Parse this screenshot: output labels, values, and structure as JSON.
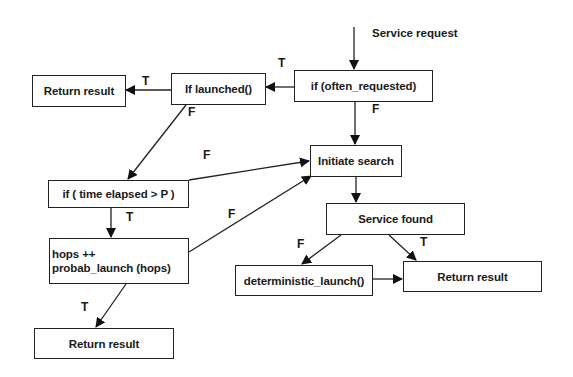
{
  "diagram": {
    "entry_label": "Service request",
    "nodes": {
      "often_requested": "if (often_requested)",
      "launched": "If launched()",
      "return_top": "Return result",
      "initiate_search": "Initiate search",
      "time_elapsed": "if ( time elapsed > P )",
      "hops_line1": "hops ++",
      "hops_line2": "probab_launch (hops)",
      "return_bottom": "Return result",
      "service_found": "Service found",
      "deterministic_launch": "deterministic_launch()",
      "return_right": "Return result"
    },
    "edge_labels": {
      "often_to_launched": "T",
      "often_to_search": "F",
      "launched_to_return": "T",
      "launched_to_time": "F",
      "time_to_search": "F",
      "time_to_hops": "T",
      "hops_to_search": "F",
      "hops_to_return": "T",
      "found_to_deterministic": "F",
      "found_to_return": "T"
    }
  }
}
